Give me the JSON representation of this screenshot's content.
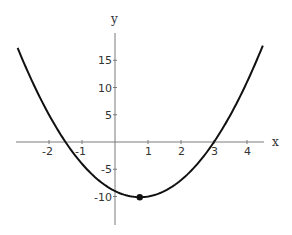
{
  "chart_data": {
    "type": "line",
    "title": "",
    "function": "y = 2x^2 - 3x - 9",
    "xlabel": "x",
    "ylabel": "y",
    "xlim": [
      -3,
      4.5
    ],
    "ylim": [
      -13,
      19
    ],
    "grid": false,
    "legend": null,
    "x_ticks": [
      -2,
      -1,
      1,
      2,
      3,
      4
    ],
    "x_tick_labels": [
      "-2",
      "-1",
      "1",
      "2",
      "3",
      "4"
    ],
    "y_ticks": [
      15,
      10,
      5,
      -5,
      -10
    ],
    "y_tick_labels": [
      "15",
      "10",
      "5",
      "-5",
      "-10"
    ],
    "series": [
      {
        "name": "parabola",
        "x": [
          -2.95,
          -2.5,
          -2,
          -1.5,
          -1,
          -0.5,
          0,
          0.5,
          0.75,
          1,
          1.5,
          2,
          2.5,
          3,
          3.5,
          4,
          4.48
        ],
        "y": [
          16.26,
          11,
          5,
          0,
          -4,
          -7,
          -9,
          -10,
          -10.125,
          -10,
          -9,
          -7,
          -4,
          0,
          4,
          11,
          17.7
        ]
      }
    ],
    "annotations": [
      {
        "type": "point",
        "label": "vertex",
        "x": 0.75,
        "y": -10.125
      }
    ],
    "roots": [
      -1.5,
      3
    ]
  },
  "axes": {
    "x_label": "x",
    "y_label": "y"
  },
  "style": {
    "curve_color": "#111111",
    "axis_color": "#7a7a7a",
    "text_color": "#333333",
    "background": "#ffffff"
  }
}
